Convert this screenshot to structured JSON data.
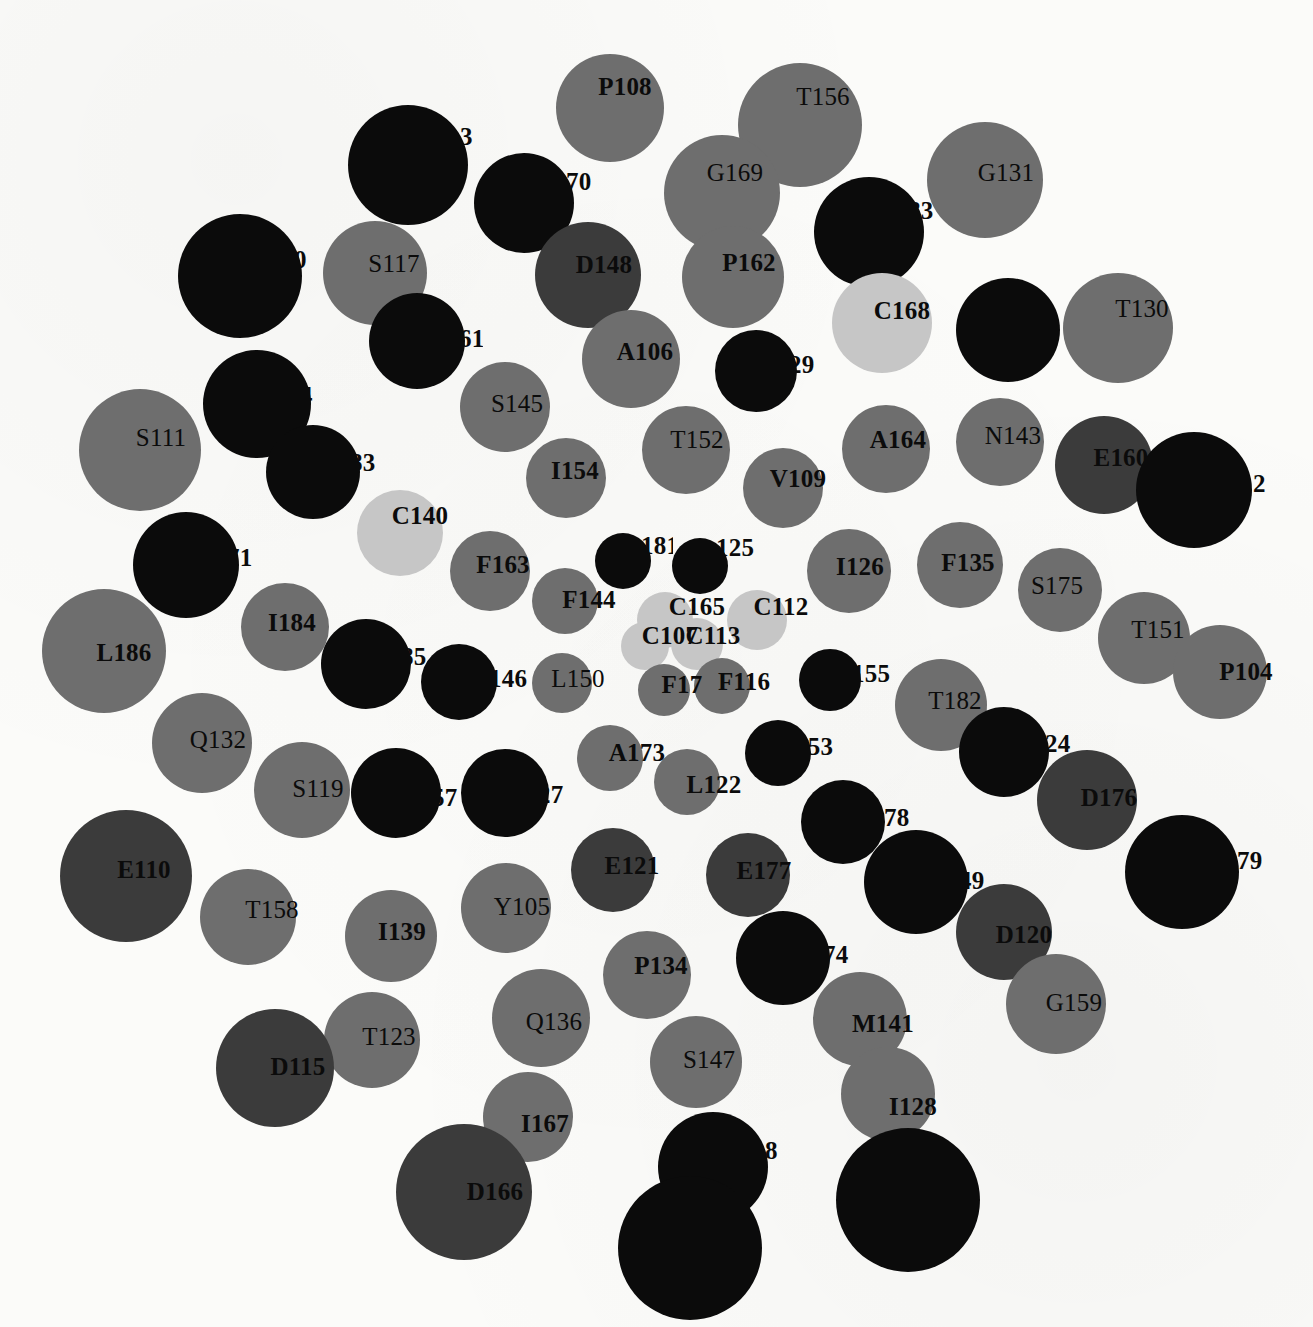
{
  "figure": {
    "type": "node-graph",
    "background": "#fbfbf9",
    "width": 1313,
    "height": 1327
  },
  "palette": {
    "black": "#0b0b0b",
    "dark_gray": "#3b3b3b",
    "mid_gray": "#6e6e6e",
    "light_gray": "#c6c6c6"
  },
  "nodes": [
    {
      "label": "P108",
      "x": 610,
      "y": 108,
      "r": 54,
      "fill": "#6e6e6e",
      "lx": 625,
      "ly": 87,
      "fs": 25,
      "bold": true,
      "clip": false
    },
    {
      "label": "T156",
      "x": 800,
      "y": 125,
      "r": 62,
      "fill": "#6e6e6e",
      "lx": 823,
      "ly": 97,
      "fs": 25,
      "bold": false,
      "clip": false
    },
    {
      "label": "3",
      "x": 408,
      "y": 165,
      "r": 60,
      "fill": "#0b0b0b",
      "lx": 460,
      "ly": 137,
      "fs": 25,
      "bold": true,
      "clip": true,
      "cw": 18
    },
    {
      "label": "G169",
      "x": 722,
      "y": 193,
      "r": 58,
      "fill": "#6e6e6e",
      "lx": 735,
      "ly": 173,
      "fs": 25,
      "bold": false,
      "clip": false
    },
    {
      "label": "G131",
      "x": 985,
      "y": 180,
      "r": 58,
      "fill": "#6e6e6e",
      "lx": 1006,
      "ly": 173,
      "fs": 25,
      "bold": false,
      "clip": false
    },
    {
      "label": "70",
      "x": 524,
      "y": 203,
      "r": 50,
      "fill": "#0b0b0b",
      "lx": 566,
      "ly": 182,
      "fs": 25,
      "bold": true,
      "clip": true,
      "cw": 26
    },
    {
      "label": "83",
      "x": 869,
      "y": 232,
      "r": 55,
      "fill": "#0b0b0b",
      "lx": 908,
      "ly": 211,
      "fs": 25,
      "bold": true,
      "clip": true,
      "cw": 26
    },
    {
      "label": "0",
      "x": 240,
      "y": 276,
      "r": 62,
      "fill": "#0b0b0b",
      "lx": 294,
      "ly": 260,
      "fs": 25,
      "bold": true,
      "clip": true,
      "cw": 16
    },
    {
      "label": "S117",
      "x": 375,
      "y": 273,
      "r": 52,
      "fill": "#6e6e6e",
      "lx": 394,
      "ly": 264,
      "fs": 25,
      "bold": false,
      "clip": false
    },
    {
      "label": "D148",
      "x": 588,
      "y": 275,
      "r": 53,
      "fill": "#3b3b3b",
      "lx": 604,
      "ly": 265,
      "fs": 25,
      "bold": true,
      "clip": false
    },
    {
      "label": "P162",
      "x": 733,
      "y": 277,
      "r": 51,
      "fill": "#6e6e6e",
      "lx": 749,
      "ly": 263,
      "fs": 25,
      "bold": true,
      "clip": false
    },
    {
      "label": "T130",
      "x": 1118,
      "y": 328,
      "r": 55,
      "fill": "#6e6e6e",
      "lx": 1142,
      "ly": 309,
      "fs": 25,
      "bold": false,
      "clip": false
    },
    {
      "label": "C168",
      "x": 882,
      "y": 323,
      "r": 50,
      "fill": "#c6c6c6",
      "lx": 902,
      "ly": 311,
      "fs": 25,
      "bold": true,
      "clip": false
    },
    {
      "label": "",
      "x": 1008,
      "y": 330,
      "r": 52,
      "fill": "#0b0b0b",
      "lx": 1058,
      "ly": 312,
      "fs": 25,
      "bold": true,
      "clip": true,
      "cw": 8
    },
    {
      "label": "61",
      "x": 417,
      "y": 341,
      "r": 48,
      "fill": "#0b0b0b",
      "lx": 459,
      "ly": 339,
      "fs": 25,
      "bold": true,
      "clip": true,
      "cw": 24
    },
    {
      "label": "A106",
      "x": 631,
      "y": 359,
      "r": 49,
      "fill": "#6e6e6e",
      "lx": 645,
      "ly": 352,
      "fs": 25,
      "bold": true,
      "clip": false
    },
    {
      "label": "29",
      "x": 756,
      "y": 371,
      "r": 41,
      "fill": "#0b0b0b",
      "lx": 789,
      "ly": 365,
      "fs": 25,
      "bold": true,
      "clip": true,
      "cw": 26
    },
    {
      "label": "4",
      "x": 257,
      "y": 404,
      "r": 54,
      "fill": "#0b0b0b",
      "lx": 300,
      "ly": 396,
      "fs": 25,
      "bold": true,
      "clip": true,
      "cw": 16
    },
    {
      "label": "S145",
      "x": 505,
      "y": 407,
      "r": 45,
      "fill": "#6e6e6e",
      "lx": 517,
      "ly": 404,
      "fs": 25,
      "bold": false,
      "clip": false
    },
    {
      "label": "S111",
      "x": 140,
      "y": 450,
      "r": 61,
      "fill": "#6e6e6e",
      "lx": 161,
      "ly": 438,
      "fs": 25,
      "bold": false,
      "clip": false
    },
    {
      "label": "T152",
      "x": 686,
      "y": 450,
      "r": 44,
      "fill": "#6e6e6e",
      "lx": 697,
      "ly": 440,
      "fs": 25,
      "bold": false,
      "clip": false
    },
    {
      "label": "A164",
      "x": 886,
      "y": 449,
      "r": 44,
      "fill": "#6e6e6e",
      "lx": 898,
      "ly": 440,
      "fs": 25,
      "bold": true,
      "clip": false
    },
    {
      "label": "N143",
      "x": 1000,
      "y": 442,
      "r": 44,
      "fill": "#6e6e6e",
      "lx": 1013,
      "ly": 436,
      "fs": 25,
      "bold": false,
      "clip": false
    },
    {
      "label": "E160",
      "x": 1104,
      "y": 465,
      "r": 49,
      "fill": "#3b3b3b",
      "lx": 1121,
      "ly": 458,
      "fs": 25,
      "bold": true,
      "clip": false
    },
    {
      "label": "83",
      "x": 313,
      "y": 472,
      "r": 47,
      "fill": "#0b0b0b",
      "lx": 350,
      "ly": 463,
      "fs": 25,
      "bold": true,
      "clip": true,
      "cw": 26
    },
    {
      "label": "I154",
      "x": 566,
      "y": 478,
      "r": 40,
      "fill": "#6e6e6e",
      "lx": 575,
      "ly": 471,
      "fs": 25,
      "bold": true,
      "clip": false
    },
    {
      "label": "V109",
      "x": 783,
      "y": 488,
      "r": 40,
      "fill": "#6e6e6e",
      "lx": 798,
      "ly": 479,
      "fs": 25,
      "bold": true,
      "clip": false
    },
    {
      "label": "2",
      "x": 1194,
      "y": 490,
      "r": 58,
      "fill": "#0b0b0b",
      "lx": 1253,
      "ly": 484,
      "fs": 25,
      "bold": true,
      "clip": true,
      "cw": 14
    },
    {
      "label": "C140",
      "x": 400,
      "y": 533,
      "r": 43,
      "fill": "#c6c6c6",
      "lx": 420,
      "ly": 516,
      "fs": 25,
      "bold": true,
      "clip": false
    },
    {
      "label": "F163",
      "x": 490,
      "y": 571,
      "r": 40,
      "fill": "#6e6e6e",
      "lx": 503,
      "ly": 565,
      "fs": 25,
      "bold": true,
      "clip": false
    },
    {
      "label": "181",
      "x": 623,
      "y": 561,
      "r": 28,
      "fill": "#0b0b0b",
      "lx": 641,
      "ly": 546,
      "fs": 25,
      "bold": true,
      "clip": true,
      "cw": 32
    },
    {
      "label": "125",
      "x": 700,
      "y": 566,
      "r": 28,
      "fill": "#0b0b0b",
      "lx": 716,
      "ly": 548,
      "fs": 25,
      "bold": true,
      "clip": true,
      "cw": 40
    },
    {
      "label": "I126",
      "x": 849,
      "y": 571,
      "r": 42,
      "fill": "#6e6e6e",
      "lx": 860,
      "ly": 567,
      "fs": 25,
      "bold": true,
      "clip": false
    },
    {
      "label": "F135",
      "x": 960,
      "y": 565,
      "r": 43,
      "fill": "#6e6e6e",
      "lx": 968,
      "ly": 563,
      "fs": 25,
      "bold": true,
      "clip": false
    },
    {
      "label": "71",
      "x": 186,
      "y": 565,
      "r": 53,
      "fill": "#0b0b0b",
      "lx": 227,
      "ly": 558,
      "fs": 25,
      "bold": true,
      "clip": true,
      "cw": 26
    },
    {
      "label": "S175",
      "x": 1060,
      "y": 590,
      "r": 42,
      "fill": "#6e6e6e",
      "lx": 1057,
      "ly": 586,
      "fs": 25,
      "bold": false,
      "clip": false
    },
    {
      "label": "F144",
      "x": 565,
      "y": 601,
      "r": 33,
      "fill": "#6e6e6e",
      "lx": 589,
      "ly": 600,
      "fs": 25,
      "bold": true,
      "clip": false
    },
    {
      "label": "C165",
      "x": 665,
      "y": 620,
      "r": 28,
      "fill": "#c6c6c6",
      "lx": 697,
      "ly": 607,
      "fs": 25,
      "bold": true,
      "clip": false
    },
    {
      "label": "C112",
      "x": 757,
      "y": 620,
      "r": 30,
      "fill": "#c6c6c6",
      "lx": 781,
      "ly": 607,
      "fs": 25,
      "bold": true,
      "clip": false
    },
    {
      "label": "I184",
      "x": 285,
      "y": 627,
      "r": 44,
      "fill": "#6e6e6e",
      "lx": 292,
      "ly": 623,
      "fs": 25,
      "bold": true,
      "clip": false
    },
    {
      "label": "L186",
      "x": 104,
      "y": 651,
      "r": 62,
      "fill": "#6e6e6e",
      "lx": 124,
      "ly": 653,
      "fs": 25,
      "bold": true,
      "clip": false
    },
    {
      "label": "T151",
      "x": 1144,
      "y": 638,
      "r": 46,
      "fill": "#6e6e6e",
      "lx": 1158,
      "ly": 630,
      "fs": 25,
      "bold": false,
      "clip": false
    },
    {
      "label": "C107",
      "x": 645,
      "y": 646,
      "r": 24,
      "fill": "#c6c6c6",
      "lx": 670,
      "ly": 636,
      "fs": 25,
      "bold": true,
      "clip": false
    },
    {
      "label": "C113",
      "x": 697,
      "y": 644,
      "r": 26,
      "fill": "#c6c6c6",
      "lx": 713,
      "ly": 636,
      "fs": 25,
      "bold": true,
      "clip": false
    },
    {
      "label": "P104",
      "x": 1220,
      "y": 672,
      "r": 47,
      "fill": "#6e6e6e",
      "lx": 1246,
      "ly": 672,
      "fs": 25,
      "bold": true,
      "clip": false
    },
    {
      "label": "85",
      "x": 366,
      "y": 664,
      "r": 45,
      "fill": "#0b0b0b",
      "lx": 401,
      "ly": 657,
      "fs": 25,
      "bold": true,
      "clip": true,
      "cw": 26
    },
    {
      "label": "146",
      "x": 459,
      "y": 682,
      "r": 38,
      "fill": "#0b0b0b",
      "lx": 489,
      "ly": 679,
      "fs": 25,
      "bold": true,
      "clip": true,
      "cw": 40
    },
    {
      "label": "L150",
      "x": 562,
      "y": 683,
      "r": 30,
      "fill": "#6e6e6e",
      "lx": 578,
      "ly": 679,
      "fs": 25,
      "bold": false,
      "clip": false
    },
    {
      "label": "F17",
      "x": 664,
      "y": 690,
      "r": 26,
      "fill": "#6e6e6e",
      "lx": 682,
      "ly": 685,
      "fs": 25,
      "bold": true,
      "clip": false
    },
    {
      "label": "F116",
      "x": 722,
      "y": 686,
      "r": 28,
      "fill": "#6e6e6e",
      "lx": 744,
      "ly": 682,
      "fs": 25,
      "bold": true,
      "clip": false
    },
    {
      "label": "155",
      "x": 830,
      "y": 680,
      "r": 31,
      "fill": "#0b0b0b",
      "lx": 852,
      "ly": 674,
      "fs": 25,
      "bold": true,
      "clip": true,
      "cw": 40
    },
    {
      "label": "T182",
      "x": 941,
      "y": 705,
      "r": 46,
      "fill": "#6e6e6e",
      "lx": 955,
      "ly": 701,
      "fs": 25,
      "bold": false,
      "clip": false
    },
    {
      "label": "Q132",
      "x": 202,
      "y": 743,
      "r": 50,
      "fill": "#6e6e6e",
      "lx": 218,
      "ly": 740,
      "fs": 25,
      "bold": false,
      "clip": false
    },
    {
      "label": "A173",
      "x": 610,
      "y": 758,
      "r": 33,
      "fill": "#6e6e6e",
      "lx": 637,
      "ly": 753,
      "fs": 25,
      "bold": true,
      "clip": false
    },
    {
      "label": "153",
      "x": 778,
      "y": 753,
      "r": 33,
      "fill": "#0b0b0b",
      "lx": 795,
      "ly": 747,
      "fs": 25,
      "bold": true,
      "clip": true,
      "cw": 42
    },
    {
      "label": "24",
      "x": 1004,
      "y": 752,
      "r": 45,
      "fill": "#0b0b0b",
      "lx": 1045,
      "ly": 744,
      "fs": 25,
      "bold": true,
      "clip": true,
      "cw": 26
    },
    {
      "label": "S119",
      "x": 302,
      "y": 790,
      "r": 48,
      "fill": "#6e6e6e",
      "lx": 318,
      "ly": 789,
      "fs": 25,
      "bold": false,
      "clip": false
    },
    {
      "label": "57",
      "x": 396,
      "y": 793,
      "r": 45,
      "fill": "#0b0b0b",
      "lx": 432,
      "ly": 798,
      "fs": 25,
      "bold": true,
      "clip": true,
      "cw": 26
    },
    {
      "label": "27",
      "x": 505,
      "y": 793,
      "r": 44,
      "fill": "#0b0b0b",
      "lx": 538,
      "ly": 795,
      "fs": 25,
      "bold": true,
      "clip": true,
      "cw": 26
    },
    {
      "label": "L122",
      "x": 687,
      "y": 782,
      "r": 33,
      "fill": "#6e6e6e",
      "lx": 714,
      "ly": 785,
      "fs": 25,
      "bold": true,
      "clip": false
    },
    {
      "label": "D176",
      "x": 1087,
      "y": 800,
      "r": 50,
      "fill": "#3b3b3b",
      "lx": 1109,
      "ly": 798,
      "fs": 25,
      "bold": true,
      "clip": false
    },
    {
      "label": "78",
      "x": 843,
      "y": 822,
      "r": 42,
      "fill": "#0b0b0b",
      "lx": 884,
      "ly": 818,
      "fs": 25,
      "bold": true,
      "clip": true,
      "cw": 26
    },
    {
      "label": "E121",
      "x": 613,
      "y": 870,
      "r": 42,
      "fill": "#3b3b3b",
      "lx": 632,
      "ly": 866,
      "fs": 25,
      "bold": true,
      "clip": false
    },
    {
      "label": "E177",
      "x": 748,
      "y": 875,
      "r": 42,
      "fill": "#3b3b3b",
      "lx": 764,
      "ly": 871,
      "fs": 25,
      "bold": true,
      "clip": false
    },
    {
      "label": "E110",
      "x": 126,
      "y": 876,
      "r": 66,
      "fill": "#3b3b3b",
      "lx": 144,
      "ly": 870,
      "fs": 25,
      "bold": true,
      "clip": false
    },
    {
      "label": "79",
      "x": 1182,
      "y": 872,
      "r": 57,
      "fill": "#0b0b0b",
      "lx": 1237,
      "ly": 861,
      "fs": 25,
      "bold": true,
      "clip": true,
      "cw": 26
    },
    {
      "label": "49",
      "x": 916,
      "y": 882,
      "r": 52,
      "fill": "#0b0b0b",
      "lx": 959,
      "ly": 881,
      "fs": 25,
      "bold": true,
      "clip": true,
      "cw": 26
    },
    {
      "label": "Y105",
      "x": 506,
      "y": 908,
      "r": 45,
      "fill": "#6e6e6e",
      "lx": 522,
      "ly": 907,
      "fs": 25,
      "bold": false,
      "clip": false
    },
    {
      "label": "T158",
      "x": 248,
      "y": 917,
      "r": 48,
      "fill": "#6e6e6e",
      "lx": 272,
      "ly": 910,
      "fs": 25,
      "bold": false,
      "clip": false
    },
    {
      "label": "I139",
      "x": 391,
      "y": 936,
      "r": 46,
      "fill": "#6e6e6e",
      "lx": 402,
      "ly": 932,
      "fs": 25,
      "bold": true,
      "clip": false
    },
    {
      "label": "D120",
      "x": 1004,
      "y": 932,
      "r": 48,
      "fill": "#3b3b3b",
      "lx": 1024,
      "ly": 935,
      "fs": 25,
      "bold": true,
      "clip": false
    },
    {
      "label": "74",
      "x": 783,
      "y": 958,
      "r": 47,
      "fill": "#0b0b0b",
      "lx": 823,
      "ly": 955,
      "fs": 25,
      "bold": true,
      "clip": true,
      "cw": 26
    },
    {
      "label": "P134",
      "x": 647,
      "y": 975,
      "r": 44,
      "fill": "#6e6e6e",
      "lx": 661,
      "ly": 966,
      "fs": 25,
      "bold": true,
      "clip": false
    },
    {
      "label": "G159",
      "x": 1056,
      "y": 1004,
      "r": 50,
      "fill": "#6e6e6e",
      "lx": 1074,
      "ly": 1003,
      "fs": 25,
      "bold": false,
      "clip": false
    },
    {
      "label": "M141",
      "x": 860,
      "y": 1019,
      "r": 47,
      "fill": "#6e6e6e",
      "lx": 883,
      "ly": 1024,
      "fs": 25,
      "bold": true,
      "clip": false
    },
    {
      "label": "Q136",
      "x": 541,
      "y": 1018,
      "r": 49,
      "fill": "#6e6e6e",
      "lx": 554,
      "ly": 1022,
      "fs": 25,
      "bold": false,
      "clip": false
    },
    {
      "label": "T123",
      "x": 372,
      "y": 1040,
      "r": 48,
      "fill": "#6e6e6e",
      "lx": 389,
      "ly": 1037,
      "fs": 25,
      "bold": false,
      "clip": false
    },
    {
      "label": "S147",
      "x": 696,
      "y": 1062,
      "r": 46,
      "fill": "#6e6e6e",
      "lx": 709,
      "ly": 1060,
      "fs": 25,
      "bold": false,
      "clip": false
    },
    {
      "label": "D115",
      "x": 275,
      "y": 1068,
      "r": 59,
      "fill": "#3b3b3b",
      "lx": 298,
      "ly": 1067,
      "fs": 25,
      "bold": true,
      "clip": false
    },
    {
      "label": "I128",
      "x": 888,
      "y": 1094,
      "r": 47,
      "fill": "#6e6e6e",
      "lx": 913,
      "ly": 1107,
      "fs": 25,
      "bold": true,
      "clip": false
    },
    {
      "label": "I167",
      "x": 528,
      "y": 1117,
      "r": 45,
      "fill": "#6e6e6e",
      "lx": 545,
      "ly": 1124,
      "fs": 25,
      "bold": true,
      "clip": false
    },
    {
      "label": "8",
      "x": 713,
      "y": 1167,
      "r": 55,
      "fill": "#0b0b0b",
      "lx": 765,
      "ly": 1151,
      "fs": 25,
      "bold": true,
      "clip": true,
      "cw": 14
    },
    {
      "label": "D166",
      "x": 464,
      "y": 1192,
      "r": 68,
      "fill": "#3b3b3b",
      "lx": 495,
      "ly": 1192,
      "fs": 25,
      "bold": true,
      "clip": false
    },
    {
      "label": "",
      "x": 908,
      "y": 1200,
      "r": 72,
      "fill": "#0b0b0b",
      "lx": 975,
      "ly": 1190,
      "fs": 25,
      "bold": true,
      "clip": true,
      "cw": 10
    },
    {
      "label": "8",
      "x": 690,
      "y": 1248,
      "r": 72,
      "fill": "#0b0b0b",
      "lx": 743,
      "ly": 1235,
      "fs": 25,
      "bold": true,
      "clip": true,
      "cw": 14
    }
  ]
}
